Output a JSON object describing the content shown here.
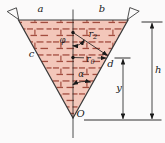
{
  "figure": {
    "labels": {
      "a": "a",
      "b": "b",
      "c": "c",
      "d": "d",
      "h": "h",
      "y": "y",
      "origin": "O",
      "r": "r",
      "sub2": "2",
      "sub0": "0",
      "phi": "φ",
      "alpha": "α"
    },
    "colors": {
      "fill": "#f3c7ba",
      "hatch": "#a34d3f",
      "line": "#3a3a3a",
      "text": "#1a1a1a"
    }
  }
}
